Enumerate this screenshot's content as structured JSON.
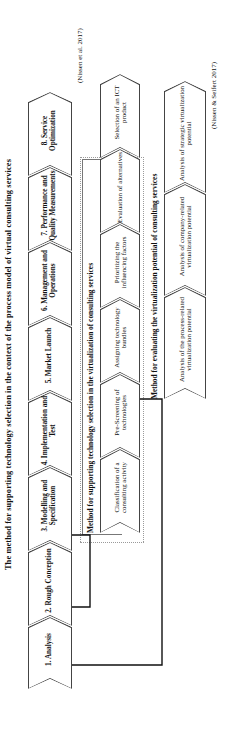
{
  "figure": {
    "title": "The method for supporting technology selection in the context of the process model of virtual consulting services",
    "subject_label": "Subject of this contribution"
  },
  "process_model": {
    "citation": "(Nissen et al. 2017)",
    "stages": [
      {
        "label": "1. Analysis"
      },
      {
        "label": "2. Rough Conception"
      },
      {
        "label": "3. Modelling and Specification"
      },
      {
        "label": "4. Implementation and Test"
      },
      {
        "label": "5. Market Launch"
      },
      {
        "label": "6. Management and Operations"
      },
      {
        "label": "7. Performance and Quality Measurements"
      },
      {
        "label": "8. Service Optimization"
      }
    ]
  },
  "technology_selection_method": {
    "title": "Method for supporting technology selection in the virtualization of consulting services",
    "stages": [
      {
        "label": "Classification of a consulting activity"
      },
      {
        "label": "Pre-Screening of technologies"
      },
      {
        "label": "Assigning technology bundles"
      },
      {
        "label": "Prioritizing the influencing factors"
      },
      {
        "label": "Evaluation of alternatives"
      },
      {
        "label": "Selection of an ICT product"
      }
    ]
  },
  "virtualization_potential_method": {
    "title": "Method for evaluating the virtualization potential of consulting services",
    "citation": "(Nissen & Seifert 2017)",
    "stages": [
      {
        "label": "Analysis of the process-related virtualization potential"
      },
      {
        "label": "Analysis of company-related virtualization potential"
      },
      {
        "label": "Analysis of strategic virtualization potential"
      }
    ]
  },
  "colors": {
    "outline": "#444444",
    "background": "#ffffff",
    "dashed_group": "#9a9a9a",
    "bracket": "#777777"
  }
}
